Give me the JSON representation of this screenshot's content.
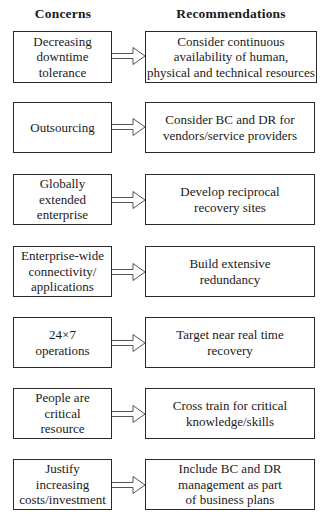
{
  "headers": {
    "concerns": "Concerns",
    "recommendations": "Recommendations"
  },
  "rows": [
    {
      "concern": "Decreasing\ndowntime\ntolerance",
      "recommendation": "Consider continuous\navailability of human,\nphysical and technical resources"
    },
    {
      "concern": "Outsourcing",
      "recommendation": "Consider BC and DR for\nvendors/service providers"
    },
    {
      "concern": "Globally\nextended\nenterprise",
      "recommendation": "Develop reciprocal\nrecovery sites"
    },
    {
      "concern": "Enterprise-wide\nconnectivity/\napplications",
      "recommendation": "Build extensive\nredundancy"
    },
    {
      "concern": "24×7\noperations",
      "recommendation": "Target near real time\nrecovery"
    },
    {
      "concern": "People are\ncritical\nresource",
      "recommendation": "Cross train for critical\nknowledge/skills"
    },
    {
      "concern": "Justify\nincreasing\ncosts/investment",
      "recommendation": "Include BC and DR\nmanagement as part\nof business plans"
    }
  ],
  "arrow_icon": "hollow-right-arrow-icon"
}
